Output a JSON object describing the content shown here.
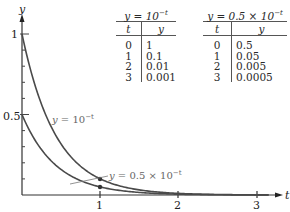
{
  "chart_data": {
    "type": "line",
    "title": "",
    "xlabel": "t",
    "ylabel": "y",
    "xlim": [
      0,
      3.2
    ],
    "ylim": [
      0,
      1.1
    ],
    "x_ticks": [
      "1",
      "2",
      "3"
    ],
    "y_ticks": [
      "0.5",
      "1"
    ],
    "grid": false,
    "legend": "inline annotations",
    "series": [
      {
        "name": "y = 10^-t",
        "label": "y = 10⁻ᵗ",
        "x": [
          0,
          1,
          2,
          3
        ],
        "y": [
          1,
          0.1,
          0.01,
          0.001
        ]
      },
      {
        "name": "y = 0.5 × 10^-t",
        "label": "y = 0.5 × 10⁻ᵗ",
        "x": [
          0,
          1,
          2,
          3
        ],
        "y": [
          0.5,
          0.05,
          0.005,
          0.0005
        ]
      }
    ],
    "marked_points": [
      {
        "x": 1,
        "y": 0.1
      },
      {
        "x": 1,
        "y": 0.05
      }
    ]
  },
  "axes": {
    "x_label": "t",
    "y_label": "y",
    "x_tick_labels": [
      "1",
      "2",
      "3"
    ],
    "y_tick_labels": [
      "1",
      "0.5"
    ]
  },
  "annotations": {
    "curve1_prefix": "y = 10",
    "curve1_exp": "−t",
    "curve2_prefix": "y = 0.5 × 10",
    "curve2_exp": "−t"
  },
  "tables": [
    {
      "title_prefix": "y = 10",
      "title_exp": "−t",
      "headers": [
        "t",
        "y"
      ],
      "rows": [
        [
          "0",
          "1"
        ],
        [
          "1",
          "0.1"
        ],
        [
          "2",
          "0.01"
        ],
        [
          "3",
          "0.001"
        ]
      ]
    },
    {
      "title_prefix": "y = 0.5 × 10",
      "title_exp": "−t",
      "headers": [
        "t",
        "y"
      ],
      "rows": [
        [
          "0",
          "0.5"
        ],
        [
          "1",
          "0.05"
        ],
        [
          "2",
          "0.005"
        ],
        [
          "3",
          "0.0005"
        ]
      ]
    }
  ]
}
